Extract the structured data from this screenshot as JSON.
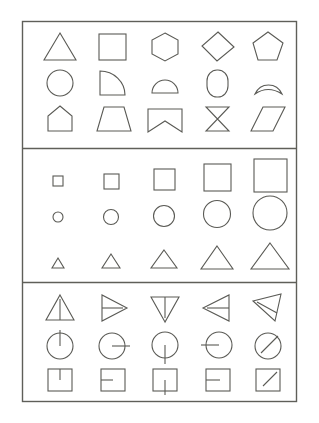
{
  "figure": {
    "background_color": "#ffffff",
    "stroke_color": "#5a5a55",
    "frame_stroke_color": "#5f5f59",
    "stroke_width": 1.1,
    "frame_stroke_width": 1.4,
    "width": 319,
    "height": 423,
    "outer_frame": {
      "x": 22,
      "y": 21,
      "w": 275,
      "h": 381
    },
    "panels": [
      {
        "id": "panel-shape-types",
        "label": "shape types",
        "rect": {
          "x": 22,
          "y": 21,
          "w": 275,
          "h": 127
        },
        "rows": [
          {
            "id": "row-polygons",
            "label": "polygons",
            "cells": [
              {
                "name": "triangle",
                "cx": 60,
                "cy": 47
              },
              {
                "name": "square",
                "cx": 113,
                "cy": 47
              },
              {
                "name": "hexagon",
                "cx": 165,
                "cy": 47
              },
              {
                "name": "diamond",
                "cx": 217,
                "cy": 47
              },
              {
                "name": "pentagon",
                "cx": 268,
                "cy": 47
              }
            ]
          },
          {
            "id": "row-curved",
            "label": "curved shapes",
            "cells": [
              {
                "name": "circle",
                "cx": 60,
                "cy": 83
              },
              {
                "name": "quarter-round",
                "cx": 113,
                "cy": 83
              },
              {
                "name": "dome",
                "cx": 165,
                "cy": 83
              },
              {
                "name": "stadium",
                "cx": 217,
                "cy": 83
              },
              {
                "name": "concave-dome",
                "cx": 268,
                "cy": 83
              }
            ]
          },
          {
            "id": "row-irregular",
            "label": "irregular shapes",
            "cells": [
              {
                "name": "house",
                "cx": 60,
                "cy": 119
              },
              {
                "name": "trapezoid",
                "cx": 113,
                "cy": 119
              },
              {
                "name": "banner",
                "cx": 165,
                "cy": 119
              },
              {
                "name": "hourglass",
                "cx": 217,
                "cy": 119
              },
              {
                "name": "parallelogram",
                "cx": 268,
                "cy": 119
              }
            ]
          }
        ]
      },
      {
        "id": "panel-size-series",
        "label": "size progression",
        "rect": {
          "x": 22,
          "y": 148,
          "w": 275,
          "h": 134
        },
        "rows": [
          {
            "id": "row-squares-sizes",
            "label": "square size series",
            "cells": [
              {
                "name": "square-size-1",
                "cx": 58,
                "cy": 181,
                "size": 10
              },
              {
                "name": "square-size-2",
                "cx": 111,
                "cy": 181,
                "size": 15
              },
              {
                "name": "square-size-3",
                "cx": 164,
                "cy": 179,
                "size": 21
              },
              {
                "name": "square-size-4",
                "cx": 217,
                "cy": 177,
                "size": 27
              },
              {
                "name": "square-size-5",
                "cx": 270,
                "cy": 175,
                "size": 33
              }
            ]
          },
          {
            "id": "row-circles-sizes",
            "label": "circle size series",
            "cells": [
              {
                "name": "circle-size-1",
                "cx": 58,
                "cy": 217,
                "size": 9
              },
              {
                "name": "circle-size-2",
                "cx": 111,
                "cy": 217,
                "size": 14
              },
              {
                "name": "circle-size-3",
                "cx": 164,
                "cy": 216,
                "size": 20
              },
              {
                "name": "circle-size-4",
                "cx": 217,
                "cy": 214,
                "size": 26
              },
              {
                "name": "circle-size-5",
                "cx": 270,
                "cy": 213,
                "size": 33
              }
            ]
          },
          {
            "id": "row-triangles-sizes",
            "label": "triangle size series",
            "cells": [
              {
                "name": "triangle-size-1",
                "cx": 58,
                "cy": 262,
                "size": 10
              },
              {
                "name": "triangle-size-2",
                "cx": 111,
                "cy": 262,
                "size": 15
              },
              {
                "name": "triangle-size-3",
                "cx": 164,
                "cy": 261,
                "size": 22
              },
              {
                "name": "triangle-size-4",
                "cx": 217,
                "cy": 260,
                "size": 29
              },
              {
                "name": "triangle-size-5",
                "cx": 270,
                "cy": 259,
                "size": 36
              }
            ]
          }
        ]
      },
      {
        "id": "panel-orientation-series",
        "label": "orientation markers",
        "rect": {
          "x": 22,
          "y": 282,
          "w": 275,
          "h": 120
        },
        "rows": [
          {
            "id": "row-triangles-orientations",
            "label": "triangle orientation series",
            "cells": [
              {
                "name": "triangle-pointing-up",
                "cx": 60,
                "cy": 308,
                "rotation": 0
              },
              {
                "name": "triangle-pointing-right",
                "cx": 113,
                "cy": 308,
                "rotation": 90
              },
              {
                "name": "triangle-pointing-down",
                "cx": 165,
                "cy": 308,
                "rotation": 180
              },
              {
                "name": "triangle-pointing-left",
                "cx": 217,
                "cy": 308,
                "rotation": 270
              },
              {
                "name": "triangle-pointing-upper-left",
                "cx": 268,
                "cy": 308,
                "rotation": 315
              }
            ]
          },
          {
            "id": "row-circles-orientations",
            "label": "circle orientation series",
            "cells": [
              {
                "name": "circle-marker-up",
                "cx": 60,
                "cy": 345,
                "angle": 270
              },
              {
                "name": "circle-marker-right",
                "cx": 113,
                "cy": 345,
                "angle": 0
              },
              {
                "name": "circle-marker-down",
                "cx": 165,
                "cy": 345,
                "angle": 90
              },
              {
                "name": "circle-marker-left",
                "cx": 217,
                "cy": 345,
                "angle": 180
              },
              {
                "name": "circle-marker-upper-right",
                "cx": 268,
                "cy": 345,
                "angle": 315
              }
            ]
          },
          {
            "id": "row-squares-orientations",
            "label": "square orientation series",
            "cells": [
              {
                "name": "square-marker-up",
                "cx": 60,
                "cy": 379,
                "angle": 270
              },
              {
                "name": "square-marker-left",
                "cx": 113,
                "cy": 379,
                "angle": 180
              },
              {
                "name": "square-marker-down",
                "cx": 165,
                "cy": 379,
                "angle": 90
              },
              {
                "name": "square-marker-left-inner",
                "cx": 217,
                "cy": 379,
                "angle": 180
              },
              {
                "name": "square-marker-upper-right",
                "cx": 268,
                "cy": 379,
                "angle": 315
              }
            ]
          }
        ]
      }
    ]
  }
}
